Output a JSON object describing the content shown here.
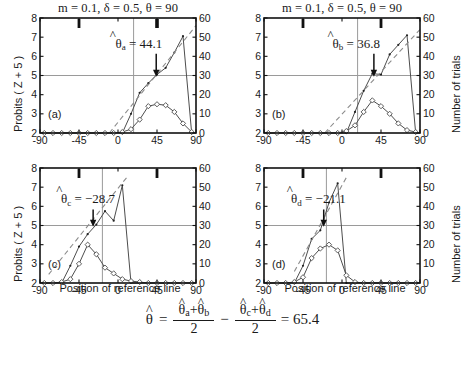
{
  "figure": {
    "equation": {
      "lhs_hat": "^",
      "lhs_sym": "θ",
      "equals": "=",
      "num1_a_sym": "θ",
      "num1_a_sub": "a",
      "num1_plus": "+",
      "num1_b_sym": "θ",
      "num1_b_sub": "b",
      "den1": "2",
      "minus": "−",
      "num2_c_sym": "θ",
      "num2_c_sub": "c",
      "num2_plus": "+",
      "num2_d_sym": "θ",
      "num2_d_sub": "d",
      "den2": "2",
      "result": "= 65.4",
      "hat": "^"
    },
    "axis_labels": {
      "y_left": "Probits ( Z + 5 )",
      "y_right": "Number of trials",
      "x": "Position of reference line"
    }
  },
  "chart_data": [
    {
      "type": "line",
      "id": "panel-a",
      "panel_letter": "(a)",
      "title": "m = 0.1, δ = 0.5, θ = 90",
      "xlabel": "",
      "ylabel": "Probits ( Z + 5 )",
      "ylabel_right": "Number of trials",
      "xlim": [
        -90,
        90
      ],
      "ylim": [
        2,
        8
      ],
      "ylim_right": [
        0,
        60
      ],
      "xticks": [
        -90,
        -45,
        0,
        45,
        90
      ],
      "xticklabels": [
        "-90",
        "-45",
        "0",
        "45",
        "90"
      ],
      "yticks": [
        2,
        3,
        4,
        5,
        6,
        7,
        8
      ],
      "yticklabels": [
        "2",
        "3",
        "4",
        "5",
        "6",
        "7",
        "8"
      ],
      "yticks_right": [
        0,
        10,
        20,
        30,
        40,
        50,
        60
      ],
      "yticklabels_right": [
        "0",
        "10",
        "20",
        "30",
        "40",
        "50",
        "60"
      ],
      "grid": false,
      "reference_hline_y": 5,
      "reference_vline_x": 18,
      "estimate_label": "44.1",
      "estimate_symbol": "θ",
      "estimate_sub": "a",
      "estimate_value": 44.1,
      "arrow_x": 44.1,
      "top_markers": [
        -45,
        45
      ],
      "series": [
        {
          "name": "probit-data",
          "marker": "dot",
          "x": [
            -85,
            -75,
            -65,
            -55,
            -45,
            -35,
            -25,
            -15,
            -5,
            5,
            15,
            25,
            35,
            45,
            55,
            65,
            75,
            85
          ],
          "y": [
            2,
            2,
            2,
            2,
            2,
            2,
            2,
            2,
            2,
            2,
            3.0,
            4.1,
            4.6,
            5.05,
            5.4,
            6.2,
            7.05,
            2
          ]
        },
        {
          "name": "probit-fit",
          "marker": "none",
          "style": "dashed",
          "x": [
            -10,
            90
          ],
          "y": [
            2.0,
            7.6
          ]
        },
        {
          "name": "trials-count",
          "marker": "diamond",
          "axis": "right",
          "x": [
            -85,
            -75,
            -65,
            -55,
            -45,
            -35,
            -25,
            -15,
            -5,
            5,
            15,
            25,
            35,
            45,
            55,
            65,
            75,
            85
          ],
          "y_right": [
            0,
            0,
            0,
            0,
            0,
            0,
            0,
            0,
            0,
            0.5,
            2,
            7,
            14,
            15,
            14.5,
            11,
            5,
            0.5
          ]
        }
      ]
    },
    {
      "type": "line",
      "id": "panel-b",
      "panel_letter": "(b)",
      "title": "m = 0.1, δ = 0.5, θ = 90",
      "xlabel": "",
      "ylabel": "Probits ( Z + 5 )",
      "ylabel_right": "Number of trials",
      "xlim": [
        -90,
        90
      ],
      "ylim": [
        2,
        8
      ],
      "ylim_right": [
        0,
        60
      ],
      "xticks": [
        -90,
        -45,
        0,
        45,
        90
      ],
      "xticklabels": [
        "-90",
        "-45",
        "0",
        "45",
        "90"
      ],
      "yticks": [
        2,
        3,
        4,
        5,
        6,
        7,
        8
      ],
      "yticklabels": [
        "2",
        "3",
        "4",
        "5",
        "6",
        "7",
        "8"
      ],
      "yticks_right": [
        0,
        10,
        20,
        30,
        40,
        50,
        60
      ],
      "yticklabels_right": [
        "0",
        "10",
        "20",
        "30",
        "40",
        "50",
        "60"
      ],
      "grid": false,
      "reference_hline_y": 5,
      "reference_vline_x": 18,
      "estimate_label": "36.8",
      "estimate_symbol": "θ",
      "estimate_sub": "b",
      "estimate_value": 36.8,
      "arrow_x": 36.8,
      "top_markers": [
        -45,
        45
      ],
      "series": [
        {
          "name": "probit-data",
          "marker": "dot",
          "x": [
            -85,
            -75,
            -65,
            -55,
            -45,
            -35,
            -25,
            -15,
            -5,
            5,
            15,
            25,
            35,
            45,
            55,
            65,
            75,
            85
          ],
          "y": [
            2,
            2,
            2,
            2,
            2,
            2,
            2,
            2,
            2,
            2,
            3.1,
            4.2,
            5.1,
            5.05,
            6.1,
            6.6,
            7.1,
            2
          ]
        },
        {
          "name": "probit-fit",
          "marker": "none",
          "style": "dashed",
          "x": [
            -20,
            90
          ],
          "y": [
            2.0,
            7.4
          ]
        },
        {
          "name": "trials-count",
          "marker": "diamond",
          "axis": "right",
          "x": [
            -85,
            -75,
            -65,
            -55,
            -45,
            -35,
            -25,
            -15,
            -5,
            5,
            15,
            25,
            35,
            45,
            55,
            65,
            75,
            85
          ],
          "y_right": [
            0,
            0,
            0,
            0,
            0,
            0,
            0,
            0,
            0,
            1,
            4,
            11,
            17,
            14,
            10,
            5,
            1.5,
            0.5
          ]
        }
      ]
    },
    {
      "type": "line",
      "id": "panel-c",
      "panel_letter": "(c)",
      "title": "",
      "xlabel": "Position of reference line",
      "ylabel": "Probits ( Z + 5 )",
      "ylabel_right": "Number of trials",
      "xlim": [
        -90,
        90
      ],
      "ylim": [
        2,
        8
      ],
      "ylim_right": [
        0,
        60
      ],
      "xticks": [
        -90,
        -45,
        0,
        45,
        90
      ],
      "xticklabels": [
        "-90",
        "-45",
        "0",
        "45",
        "90"
      ],
      "yticks": [
        2,
        3,
        4,
        5,
        6,
        7,
        8
      ],
      "yticklabels": [
        "2",
        "3",
        "4",
        "5",
        "6",
        "7",
        "8"
      ],
      "yticks_right": [
        0,
        10,
        20,
        30,
        40,
        50,
        60
      ],
      "yticklabels_right": [
        "0",
        "10",
        "20",
        "30",
        "40",
        "50",
        "60"
      ],
      "grid": false,
      "reference_hline_y": 5,
      "reference_vline_x": -18,
      "estimate_label": "−28.7",
      "estimate_symbol": "θ",
      "estimate_sub": "c",
      "estimate_value": -28.7,
      "arrow_x": -28.7,
      "top_markers": [
        -45,
        45
      ],
      "series": [
        {
          "name": "probit-data",
          "marker": "dot",
          "x": [
            -85,
            -75,
            -65,
            -55,
            -45,
            -35,
            -25,
            -15,
            -5,
            5,
            15,
            25,
            35,
            45,
            55,
            65,
            75,
            85
          ],
          "y": [
            2,
            2,
            2,
            2.9,
            3.9,
            4.55,
            5.05,
            5.75,
            5.25,
            7.1,
            2,
            2,
            2,
            2,
            2,
            2,
            2,
            2
          ]
        },
        {
          "name": "probit-fit",
          "marker": "none",
          "style": "dashed",
          "x": [
            -80,
            10
          ],
          "y": [
            2.45,
            7.5
          ]
        },
        {
          "name": "trials-count",
          "marker": "diamond",
          "axis": "right",
          "x": [
            -85,
            -75,
            -65,
            -55,
            -45,
            -35,
            -25,
            -15,
            -5,
            5,
            15,
            25,
            35,
            45,
            55,
            65,
            75,
            85
          ],
          "y_right": [
            0,
            0,
            0.5,
            2,
            10,
            20,
            15,
            8,
            5,
            2,
            1,
            0.5,
            0,
            0,
            0,
            0,
            0,
            0
          ]
        }
      ]
    },
    {
      "type": "line",
      "id": "panel-d",
      "panel_letter": "(d)",
      "title": "",
      "xlabel": "Position of reference line",
      "ylabel": "Probits ( Z + 5 )",
      "ylabel_right": "Number of trials",
      "xlim": [
        -90,
        90
      ],
      "ylim": [
        2,
        8
      ],
      "ylim_right": [
        0,
        60
      ],
      "xticks": [
        -90,
        -45,
        0,
        45,
        90
      ],
      "xticklabels": [
        "-90",
        "-45",
        "0",
        "45",
        "90"
      ],
      "yticks": [
        2,
        3,
        4,
        5,
        6,
        7,
        8
      ],
      "yticklabels": [
        "2",
        "3",
        "4",
        "5",
        "6",
        "7",
        "8"
      ],
      "yticks_right": [
        0,
        10,
        20,
        30,
        40,
        50,
        60
      ],
      "yticklabels_right": [
        "0",
        "10",
        "20",
        "30",
        "40",
        "50",
        "60"
      ],
      "grid": false,
      "reference_hline_y": 5,
      "reference_vline_x": -18,
      "estimate_label": "−21.1",
      "estimate_symbol": "θ",
      "estimate_sub": "d",
      "estimate_value": -21.1,
      "arrow_x": -21.1,
      "top_markers": [
        -45,
        45
      ],
      "series": [
        {
          "name": "probit-data",
          "marker": "dot",
          "x": [
            -85,
            -75,
            -65,
            -55,
            -45,
            -35,
            -25,
            -15,
            -5,
            5,
            15,
            25,
            35,
            45,
            55,
            65,
            75,
            85
          ],
          "y": [
            2,
            2,
            2,
            2,
            2.9,
            4.3,
            4.75,
            6.2,
            7.2,
            2,
            2,
            2,
            2,
            2,
            2,
            2,
            2,
            2
          ]
        },
        {
          "name": "probit-fit",
          "marker": "none",
          "style": "dashed",
          "x": [
            -55,
            5
          ],
          "y": [
            2.6,
            7.5
          ]
        },
        {
          "name": "trials-count",
          "marker": "diamond",
          "axis": "right",
          "x": [
            -85,
            -75,
            -65,
            -55,
            -45,
            -35,
            -25,
            -15,
            -5,
            5,
            15,
            25,
            35,
            45,
            55,
            65,
            75,
            85
          ],
          "y_right": [
            0,
            0,
            0,
            0.5,
            3,
            13,
            18,
            20,
            17,
            4,
            0.5,
            0,
            0,
            0,
            0,
            0,
            0,
            0
          ]
        }
      ]
    }
  ]
}
